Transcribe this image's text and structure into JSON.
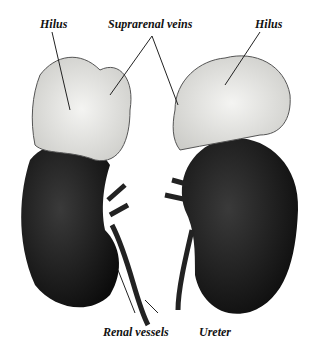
{
  "diagram": {
    "labels": {
      "hilus_left": "Hilus",
      "suprarenal_veins": "Suprarenal veins",
      "hilus_right": "Hilus",
      "renal_vessels": "Renal vessels",
      "ureter": "Ureter"
    }
  }
}
